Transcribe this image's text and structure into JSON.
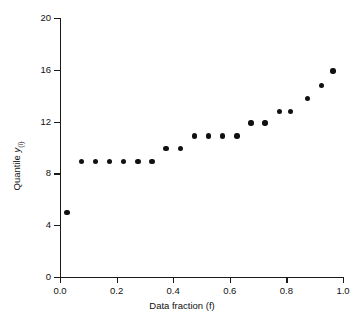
{
  "chart_data": {
    "type": "scatter",
    "title": "",
    "xlabel": "Data fraction (f)",
    "ylabel": "Quantile y(i)",
    "ylabel_main": "Quantile",
    "ylabel_symbol": "y",
    "ylabel_subscript": "(i)",
    "xlim": [
      0.0,
      1.0
    ],
    "ylim": [
      0,
      20
    ],
    "xticks": [
      0.0,
      0.2,
      0.4,
      0.6,
      0.8,
      1.0
    ],
    "xtick_labels": [
      "0.0",
      "0.2",
      "0.4",
      "0.6",
      "0.8",
      "1.0"
    ],
    "yticks": [
      0,
      4,
      8,
      12,
      16,
      20
    ],
    "ytick_labels": [
      "0",
      "4",
      "8",
      "12",
      "16",
      "20"
    ],
    "grid": false,
    "legend": null,
    "marker": "filled-circle",
    "marker_color": "#111111",
    "x": [
      0.025,
      0.075,
      0.125,
      0.175,
      0.225,
      0.275,
      0.325,
      0.375,
      0.425,
      0.475,
      0.525,
      0.575,
      0.625,
      0.675,
      0.725,
      0.775,
      0.815,
      0.875,
      0.925,
      0.965
    ],
    "y": [
      5.0,
      8.9,
      8.9,
      8.9,
      8.9,
      8.9,
      8.9,
      9.9,
      9.9,
      10.9,
      10.9,
      10.9,
      10.9,
      11.9,
      11.9,
      12.8,
      12.8,
      13.8,
      14.8,
      15.9
    ],
    "points": [
      {
        "f": 0.025,
        "q": 5.0
      },
      {
        "f": 0.075,
        "q": 8.9
      },
      {
        "f": 0.125,
        "q": 8.9
      },
      {
        "f": 0.175,
        "q": 8.9
      },
      {
        "f": 0.225,
        "q": 8.9
      },
      {
        "f": 0.275,
        "q": 8.9
      },
      {
        "f": 0.325,
        "q": 8.9
      },
      {
        "f": 0.375,
        "q": 9.9
      },
      {
        "f": 0.425,
        "q": 9.9
      },
      {
        "f": 0.475,
        "q": 10.9
      },
      {
        "f": 0.525,
        "q": 10.9
      },
      {
        "f": 0.575,
        "q": 10.9
      },
      {
        "f": 0.625,
        "q": 10.9
      },
      {
        "f": 0.675,
        "q": 11.9
      },
      {
        "f": 0.725,
        "q": 11.9
      },
      {
        "f": 0.775,
        "q": 12.8
      },
      {
        "f": 0.815,
        "q": 12.8
      },
      {
        "f": 0.875,
        "q": 13.8
      },
      {
        "f": 0.925,
        "q": 14.8
      },
      {
        "f": 0.965,
        "q": 15.9
      }
    ]
  }
}
